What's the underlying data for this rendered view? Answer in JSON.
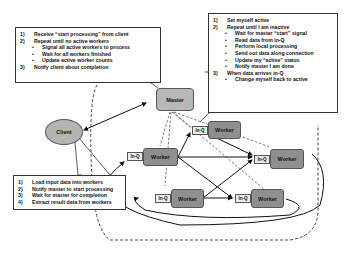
{
  "diagram": {
    "master_note": {
      "items": [
        {
          "num": "1)",
          "text": "Receive “start processing” from client"
        },
        {
          "num": "2)",
          "text": "Repeat until no active workers",
          "sub": [
            "Signal all active workers to process",
            "Wait for all workers finished",
            "Update active worker counts"
          ]
        },
        {
          "num": "3)",
          "text": "Notify client about completion"
        }
      ]
    },
    "worker_note": {
      "items": [
        {
          "num": "1)",
          "text": "Set myself active"
        },
        {
          "num": "2)",
          "text": "Repeat until I am inactive",
          "sub": [
            "Wait for master “start” signal",
            "Read data from in-Q",
            "Perform local processing",
            "Send out data along connection",
            "Update my “active” status",
            "Notify master I am done"
          ]
        },
        {
          "num": "3)",
          "text": "When data arrives in-Q",
          "sub": [
            "Change myself back to active"
          ]
        }
      ]
    },
    "client_note": {
      "items": [
        {
          "num": "1)",
          "text": "Load input data into workers"
        },
        {
          "num": "2)",
          "text": "Notify master to start processing"
        },
        {
          "num": "3)",
          "text": "Wait for master for completion"
        },
        {
          "num": "4)",
          "text": "Extract result data from workers"
        }
      ]
    },
    "nodes": {
      "master": "Master",
      "client": "Client",
      "worker": "Worker",
      "inq": "In-Q"
    },
    "colors": {
      "master_fill": "#b8b8b8",
      "client_fill": "#b4b4b4",
      "worker_fill": "#8f8f8f",
      "inq_fill": "#ececec"
    }
  }
}
